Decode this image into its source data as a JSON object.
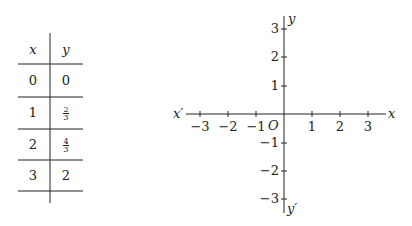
{
  "table": {
    "headers": [
      "x",
      "y"
    ],
    "rows": [
      {
        "x": "0",
        "y": "0"
      },
      {
        "x": "1",
        "y": {
          "num": "2",
          "den": "3"
        }
      },
      {
        "x": "2",
        "y": {
          "num": "4",
          "den": "3"
        }
      },
      {
        "x": "3",
        "y": "2"
      }
    ]
  },
  "axes": {
    "x_label": "x",
    "x_neg_label": "x′",
    "y_label": "y",
    "y_neg_label": "y′",
    "origin_label": "O",
    "x_ticks": [
      "−3",
      "−2",
      "−1",
      "1",
      "2",
      "3"
    ],
    "y_ticks": [
      "3",
      "2",
      "1",
      "−1",
      "−2",
      "−3"
    ],
    "x_range": [
      -3,
      3
    ],
    "y_range": [
      -3,
      3
    ]
  }
}
